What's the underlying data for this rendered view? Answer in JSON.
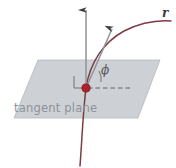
{
  "figure": {
    "kind": "geometry-diagram",
    "width": 176,
    "height": 168,
    "background_color": "#ffffff",
    "labels": {
      "plane": "tangent plane",
      "curve": "r",
      "angle": "ϕ"
    },
    "colors": {
      "plane_fill": "#c9cdd1",
      "plane_edge": "#b4b8bd",
      "curve": "#7a3b42",
      "vector": "#8f9296",
      "arrowhead": "#3b3b3b",
      "point": "#b01f2a",
      "dashed_line": "#5e6166",
      "right_angle": "#6e7276",
      "plane_label_text": "#8e9298",
      "curve_label_text": "#3a3a3a",
      "angle_label_text": "#55585c"
    },
    "geometry": {
      "plane_polygon": "38,60 160,60 138,118 14,118",
      "point_of_tangency": {
        "x": 86,
        "y": 88
      },
      "normal_vector": {
        "x1": 86,
        "y1": 88,
        "x2": 86,
        "y2": 10
      },
      "tangent_vector": {
        "x1": 86,
        "y1": 88,
        "x2": 112,
        "y2": 29
      },
      "dashed_reference_line": {
        "x1": 88,
        "y1": 88,
        "x2": 131,
        "y2": 88
      },
      "curve_path": "M 80,166 C 82,140 83,112 86,88 C 90,62 104,42 124,31 C 140,23 156,20 171,21",
      "angle_arc_path": "M 99,71 A 16,16 0 0 1 101,82",
      "right_angle_marker": "M 74,76 L 74,88 L 86,88"
    }
  }
}
